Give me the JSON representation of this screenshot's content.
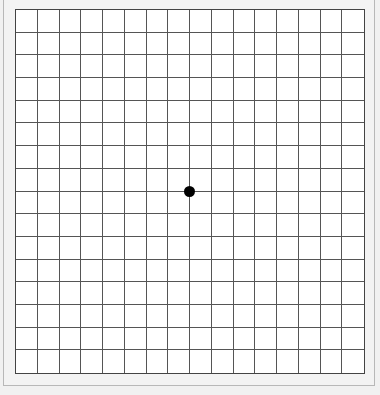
{
  "amsler_grid": {
    "columns": 16,
    "rows": 16,
    "line_color": "#555555",
    "background_color": "#ffffff",
    "frame_color": "#f3f3f3",
    "center_dot": {
      "color": "#000000",
      "shape": "circle"
    }
  }
}
